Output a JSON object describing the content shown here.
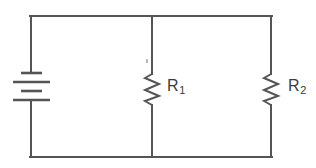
{
  "diagram": {
    "type": "electrical-circuit-schematic",
    "background_color": "#ffffff",
    "line_color": "#555555",
    "label_color": "#3b3b3b"
  },
  "components": {
    "battery": {
      "name": "battery",
      "symbol": "multi-cell-battery",
      "position": "left-branch",
      "plate_count": 4,
      "plate_pattern": "short-long-short-long"
    },
    "resistor_1": {
      "name": "resistor",
      "symbol": "zigzag-resistor",
      "position": "middle-branch",
      "label_text": "R",
      "label_subscript": "1"
    },
    "resistor_2": {
      "name": "resistor",
      "symbol": "zigzag-resistor",
      "position": "right-branch",
      "label_text": "R",
      "label_subscript": "2"
    }
  },
  "wires": {
    "top_rail": "top horizontal wire",
    "bottom_rail": "bottom horizontal wire",
    "left_branch": "left vertical wire",
    "middle_branch": "middle vertical wire",
    "right_branch": "right vertical wire"
  }
}
